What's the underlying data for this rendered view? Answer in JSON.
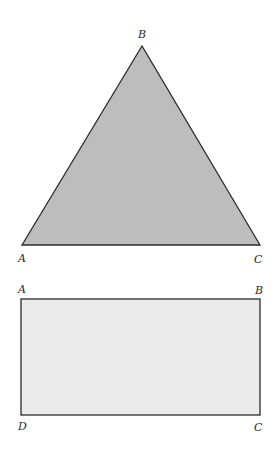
{
  "triangle": {
    "fill": "#bdbdbd",
    "stroke": "#2a2a2a",
    "vertices": {
      "B": {
        "label": "B",
        "x": 142,
        "y": 46
      },
      "A": {
        "label": "A",
        "x": 22,
        "y": 245
      },
      "C": {
        "label": "C",
        "x": 260,
        "y": 245
      }
    }
  },
  "rectangle": {
    "fill": "#ebebeb",
    "stroke": "#2a2a2a",
    "corners": {
      "A": {
        "label": "A",
        "x": 21,
        "y": 299
      },
      "B": {
        "label": "B",
        "x": 260,
        "y": 299
      },
      "C": {
        "label": "C",
        "x": 260,
        "y": 415
      },
      "D": {
        "label": "D",
        "x": 21,
        "y": 415
      }
    }
  }
}
